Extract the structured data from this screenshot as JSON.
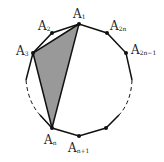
{
  "diagram": {
    "colors": {
      "stroke": "#111111",
      "fill": "#999999",
      "background": "#ffffff"
    },
    "labels": [
      {
        "id": "A1",
        "base": "A",
        "sub": "1"
      },
      {
        "id": "A2",
        "base": "A",
        "sub": "2"
      },
      {
        "id": "A3",
        "base": "A",
        "sub": "3"
      },
      {
        "id": "A2n",
        "base": "A",
        "sub": "2n"
      },
      {
        "id": "A2n-1",
        "base": "A",
        "sub": "2n−1"
      },
      {
        "id": "An",
        "base": "A",
        "sub": "n"
      },
      {
        "id": "An+1",
        "base": "A",
        "sub": "n+1"
      }
    ],
    "shaded_triangle": [
      "A1",
      "A3",
      "An"
    ]
  }
}
